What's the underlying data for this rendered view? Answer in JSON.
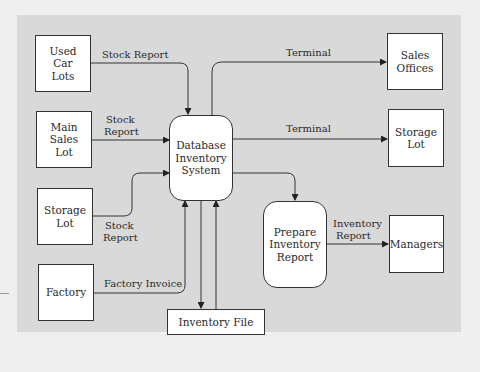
{
  "diagram": {
    "type": "data-flow-diagram",
    "entities": {
      "used_car_lots": "Used Car Lots",
      "main_sales_lot": "Main Sales Lot",
      "storage_lot_src": "Storage Lot",
      "factory": "Factory",
      "sales_offices": "Sales Offices",
      "storage_lot_dst": "Storage Lot",
      "managers": "Managers"
    },
    "processes": {
      "db_inventory": "Database Inventory System",
      "prepare_report": "Prepare Inventory Report"
    },
    "data_store": "Inventory File",
    "flows": [
      {
        "from": "Used Car Lots",
        "to": "Database Inventory System",
        "label": "Stock Report"
      },
      {
        "from": "Main Sales Lot",
        "to": "Database Inventory System",
        "label": "Stock Report"
      },
      {
        "from": "Storage Lot",
        "to": "Database Inventory System",
        "label": "Stock Report"
      },
      {
        "from": "Factory",
        "to": "Database Inventory System",
        "label": "Factory Invoice"
      },
      {
        "from": "Database Inventory System",
        "to": "Sales Offices",
        "label": "Terminal"
      },
      {
        "from": "Database Inventory System",
        "to": "Storage Lot",
        "label": "Terminal"
      },
      {
        "from": "Database Inventory System",
        "to": "Prepare Inventory Report",
        "label": ""
      },
      {
        "from": "Prepare Inventory Report",
        "to": "Managers",
        "label": "Inventory Report"
      },
      {
        "from": "Database Inventory System",
        "to": "Inventory File",
        "label": ""
      },
      {
        "from": "Inventory File",
        "to": "Database Inventory System",
        "label": ""
      }
    ],
    "labels": {
      "stock_report_1": "Stock Report",
      "stock_report_2a": "Stock",
      "stock_report_2b": "Report",
      "stock_report_3a": "Stock",
      "stock_report_3b": "Report",
      "factory_invoice": "Factory Invoice",
      "terminal_1": "Terminal",
      "terminal_2": "Terminal",
      "inv_report_a": "Inventory",
      "inv_report_b": "Report"
    },
    "colors": {
      "panel": "#d9d9d9",
      "background": "#efefef",
      "box": "#ffffff",
      "stroke": "#333333"
    }
  }
}
